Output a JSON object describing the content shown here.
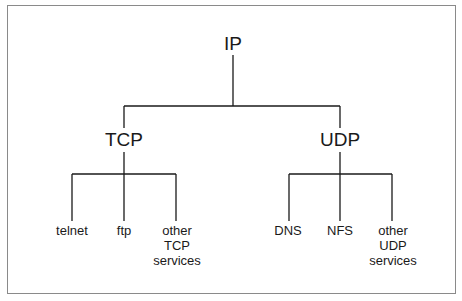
{
  "diagram": {
    "root": {
      "label": "IP"
    },
    "branches": [
      {
        "label": "TCP",
        "children": [
          "telnet",
          "ftp",
          "other TCP services"
        ]
      },
      {
        "label": "UDP",
        "children": [
          "DNS",
          "NFS",
          "other UDP services"
        ]
      }
    ]
  },
  "nodes": {
    "ip": "IP",
    "tcp": "TCP",
    "udp": "UDP",
    "telnet": "telnet",
    "ftp": "ftp",
    "tcp_other_1": "other",
    "tcp_other_2": "TCP",
    "tcp_other_3": "services",
    "dns": "DNS",
    "nfs": "NFS",
    "udp_other_1": "other",
    "udp_other_2": "UDP",
    "udp_other_3": "services"
  },
  "colors": {
    "line": "#1a1a1a",
    "frame": "#8a8a8a",
    "background": "#ffffff"
  }
}
